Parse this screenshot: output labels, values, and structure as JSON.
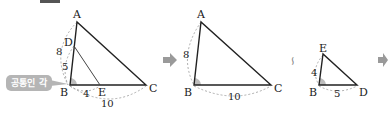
{
  "callout": {
    "label": "공통인 각"
  },
  "similar_symbol": "∽",
  "colors": {
    "line": "#222222",
    "dashed": "#999999",
    "angle_fill": "#bdbdbd",
    "arrow": "#9a9a9a",
    "callout_bg": "#b5b5b5"
  },
  "figure1": {
    "vertices": {
      "A": "A",
      "B": "B",
      "C": "C",
      "D": "D",
      "E": "E"
    },
    "lengths": {
      "AB": "8",
      "BD": "5",
      "BE": "4",
      "BC": "10"
    }
  },
  "figure2": {
    "vertices": {
      "A": "A",
      "B": "B",
      "C": "C"
    },
    "lengths": {
      "AB": "8",
      "BC": "10"
    }
  },
  "figure3": {
    "vertices": {
      "E": "E",
      "B": "B",
      "D": "D"
    },
    "lengths": {
      "BE": "4",
      "BD": "5"
    }
  }
}
